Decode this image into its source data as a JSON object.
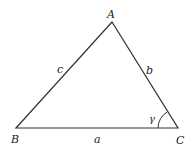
{
  "diagram": {
    "type": "triangle",
    "vertices": {
      "A": {
        "label": "A",
        "x": 112,
        "y": 22
      },
      "B": {
        "label": "B",
        "x": 16,
        "y": 128
      },
      "C": {
        "label": "C",
        "x": 178,
        "y": 128
      }
    },
    "sides": {
      "a": {
        "label": "a",
        "between": "B-C"
      },
      "b": {
        "label": "b",
        "between": "A-C"
      },
      "c": {
        "label": "c",
        "between": "A-B"
      }
    },
    "angle": {
      "label": "γ",
      "at": "C"
    },
    "colors": {
      "stroke": "#333333",
      "background": "#ffffff"
    }
  }
}
